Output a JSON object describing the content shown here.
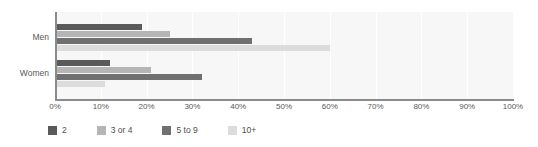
{
  "chart_data": {
    "type": "bar",
    "orientation": "horizontal",
    "title": "",
    "subtitle": "",
    "xlabel": "",
    "ylabel": "",
    "categories": [
      "Men",
      "Women"
    ],
    "series": [
      {
        "name": "2",
        "color": "#5a5a5a",
        "values": [
          19,
          12
        ]
      },
      {
        "name": "3 or 4",
        "color": "#b5b5b5",
        "values": [
          25,
          21
        ]
      },
      {
        "name": "5 to 9",
        "color": "#707070",
        "values": [
          43,
          32
        ]
      },
      {
        "name": "10+",
        "color": "#dcdcdc",
        "values": [
          60,
          11
        ]
      }
    ],
    "xlim": [
      0,
      100
    ],
    "xticks": [
      0,
      10,
      20,
      30,
      40,
      50,
      60,
      70,
      80,
      90,
      100
    ],
    "xtick_labels": [
      "0%",
      "10%",
      "20%",
      "30%",
      "40%",
      "50%",
      "60%",
      "70%",
      "80%",
      "90%",
      "100%"
    ],
    "grid": "vertical",
    "plot_background": "#f7f7f7",
    "gridline_color": "#ffffff",
    "axis_color": "#8a8a8a",
    "legend_position": "bottom-left"
  },
  "legend": {
    "items": [
      {
        "label": "2",
        "color": "#5a5a5a"
      },
      {
        "label": "3 or 4",
        "color": "#b5b5b5"
      },
      {
        "label": "5 to 9",
        "color": "#707070"
      },
      {
        "label": "10+",
        "color": "#dcdcdc"
      }
    ]
  }
}
